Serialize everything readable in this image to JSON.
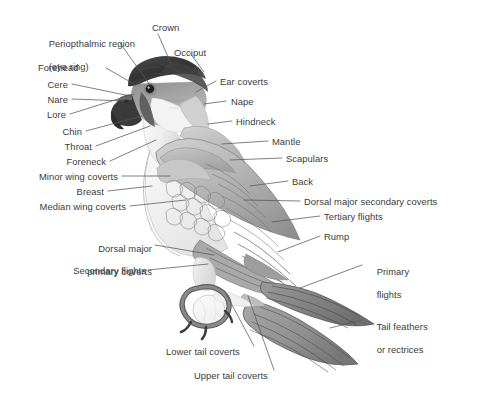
{
  "figure": {
    "background_color": "#ffffff",
    "ink_color": "#3b3b3b",
    "leader_line_color": "#555555"
  },
  "labels": {
    "periopthalmic_line1": "Periopthalmic region",
    "periopthalmic_line2": "(eye ring)",
    "forehead": "Forehead",
    "cere": "Cere",
    "nare": "Nare",
    "lore": "Lore",
    "chin": "Chin",
    "throat": "Throat",
    "foreneck": "Foreneck",
    "minor_wing_coverts": "Minor wing coverts",
    "breast": "Breast",
    "median_wing_coverts": "Median wing coverts",
    "dorsal_major_primary_coverts_line1": "Dorsal major",
    "dorsal_major_primary_coverts_line2": "primary coverts",
    "secondary_flights": "Secondary flights",
    "crown": "Crown",
    "occiput": "Occiput",
    "ear_coverts": "Ear coverts",
    "nape": "Nape",
    "hindneck": "Hindneck",
    "mantle": "Mantle",
    "scapulars": "Scapulars",
    "back": "Back",
    "dorsal_major_secondary_coverts": "Dorsal major secondary coverts",
    "tertiary_flights": "Tertiary flights",
    "rump": "Rump",
    "primary_flights_line1": "Primary",
    "primary_flights_line2": "flights",
    "tail_feathers_line1": "Tail feathers",
    "tail_feathers_line2": "or rectrices",
    "lower_tail_coverts": "Lower tail coverts",
    "upper_tail_coverts": "Upper tail coverts"
  },
  "anatomy_parts": [
    "Periopthalmic region (eye ring)",
    "Forehead",
    "Cere",
    "Nare",
    "Lore",
    "Chin",
    "Throat",
    "Foreneck",
    "Minor wing coverts",
    "Breast",
    "Median wing coverts",
    "Dorsal major primary coverts",
    "Secondary flights",
    "Crown",
    "Occiput",
    "Ear coverts",
    "Nape",
    "Hindneck",
    "Mantle",
    "Scapulars",
    "Back",
    "Dorsal major secondary coverts",
    "Tertiary flights",
    "Rump",
    "Primary flights",
    "Tail feathers or rectrices",
    "Lower tail coverts",
    "Upper tail coverts"
  ]
}
